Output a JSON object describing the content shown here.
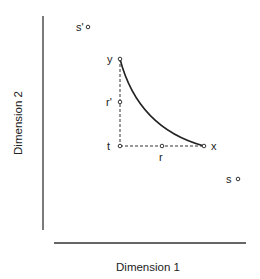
{
  "axes": {
    "x_label": "Dimension 1",
    "y_label": "Dimension 2"
  },
  "points": [
    {
      "id": "y",
      "label": "y",
      "x": 120,
      "y": 59
    },
    {
      "id": "r_prime",
      "label": "r'",
      "x": 120,
      "y": 102
    },
    {
      "id": "t",
      "label": "t",
      "x": 120,
      "y": 146
    },
    {
      "id": "r",
      "label": "r",
      "x": 162,
      "y": 146
    },
    {
      "id": "x",
      "label": "x",
      "x": 204,
      "y": 146
    },
    {
      "id": "s_prime",
      "label": "s'",
      "x": 88,
      "y": 27
    },
    {
      "id": "s",
      "label": "s",
      "x": 238,
      "y": 179
    }
  ],
  "curve": {
    "from": "y",
    "to": "x",
    "style": "solid"
  },
  "dashed_segments": [
    {
      "from": "y",
      "to": "t"
    },
    {
      "from": "t",
      "to": "x"
    }
  ],
  "colors": {
    "ink": "#222222",
    "background": "#ffffff"
  }
}
